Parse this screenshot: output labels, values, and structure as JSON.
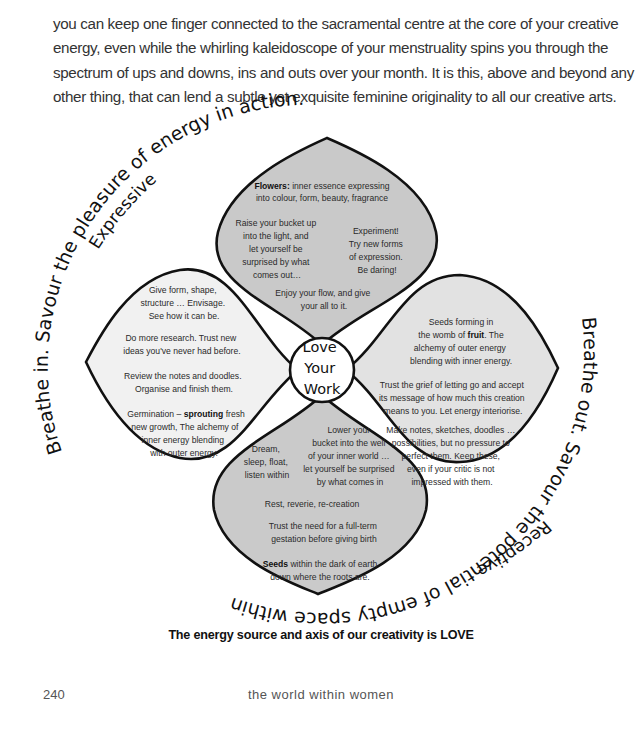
{
  "intro_paragraph": {
    "lines": [
      "creative energy … the tides of life and energy",
      "you can keep one finger connected to the sacramental centre at the core of your creative",
      "energy, even while the whirling kaleidoscope of your menstruality spins you through the",
      "spectrum of ups and downs, ins and outs over your month. It is this, above and beyond any",
      "other thing, that can lend a subtle yet exquisite feminine originality to all our creative arts."
    ]
  },
  "diagram": {
    "center": {
      "lines": [
        "Love",
        "Your",
        "Work"
      ]
    },
    "outer_labels": {
      "top_arc": "Breathe in. Savour the pleasure of energy in action.",
      "top_label": "Expressive",
      "bottom_arc": "Breathe out. Savour the potential of empty space within.",
      "bottom_label": "Receptive"
    },
    "colors": {
      "top_petal": "#c9c9c9",
      "bottom_petal": "#cacaca",
      "left_petal": "#f1f1f1",
      "right_petal": "#e2e2e2",
      "outline": "#111111"
    },
    "petals": {
      "top": {
        "heading_bold": "Flowers:",
        "heading_rest": " inner essence expressing",
        "heading_line2": "into colour, form, beauty, fragrance",
        "left_block": [
          "Raise your bucket up",
          "into the light, and",
          "let yourself be",
          "surprised by what",
          "comes out…"
        ],
        "right_block": [
          "Experiment!",
          "Try new forms",
          "of expression.",
          "Be daring!"
        ],
        "bottom_block": [
          "Enjoy your flow, and give",
          "your all to it."
        ]
      },
      "left": {
        "block1": [
          "Give form, shape,",
          "structure … Envisage.",
          "See how it can be."
        ],
        "block2": [
          "Do more research. Trust new",
          "ideas you've never had before."
        ],
        "block3": [
          "Review the notes and doodles.",
          "Organise and finish them."
        ],
        "block4_pre": "Germination – ",
        "block4_bold": "sprouting",
        "block4_post": " fresh",
        "block4_rest": [
          "new growth, The alchemy of",
          "inner energy blending",
          "with outer energy."
        ]
      },
      "right": {
        "block1_line1": "Seeds forming in",
        "block1_line2_pre": "the womb of ",
        "block1_line2_bold": "fruit",
        "block1_line2_post": ". The",
        "block1_rest": [
          "alchemy of outer energy",
          "blending with inner energy."
        ],
        "block2": [
          "Trust the grief of letting go and accept",
          "its message of how much this creation",
          "means to you. Let energy interiorise."
        ],
        "block3": [
          "Make notes, sketches, doodles …",
          "possibilities, but no pressure to",
          "perfect them. Keep these,",
          "even if your critic is not",
          "impressed with them."
        ]
      },
      "bottom": {
        "left_block": [
          "Dream,",
          "sleep, float,",
          "listen within"
        ],
        "right_block": [
          "Lower your",
          "bucket into the well",
          "of your inner world …",
          "let yourself be surprised",
          "by what comes in"
        ],
        "line_rest": "Rest, reverie, re-creation",
        "trust_block": [
          "Trust the need for a full-term",
          "gestation before giving birth"
        ],
        "seeds_bold": "Seeds",
        "seeds_rest": " within the dark of earth",
        "seeds_line2": "down where the roots are."
      }
    }
  },
  "caption": "The energy source and axis of our creativity is LOVE",
  "footer": {
    "page_number": "240",
    "book_title": "the world within women"
  }
}
